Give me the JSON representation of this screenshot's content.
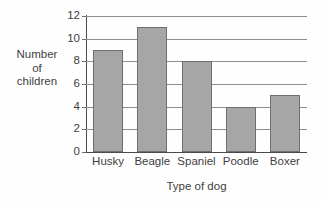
{
  "chart_data": {
    "type": "bar",
    "title": "",
    "categories": [
      "Husky",
      "Beagle",
      "Spaniel",
      "Poodle",
      "Boxer"
    ],
    "values": [
      9,
      11,
      8,
      4,
      5
    ],
    "xlabel": "Type of dog",
    "ylabel": "Number of children",
    "ylabel_lines": [
      "Number",
      "of",
      "children"
    ],
    "ylim": [
      0,
      12
    ],
    "ytick_labels": [
      "0",
      "2",
      "4",
      "6",
      "8",
      "10",
      "12"
    ],
    "ytick_values": [
      0,
      2,
      4,
      6,
      8,
      10,
      12
    ],
    "grid": "horizontal",
    "legend": "none",
    "colors": {
      "bar_fill": "#a6a6a6",
      "bar_edge": "#6f6f6f",
      "gridline": "#8e8e8e",
      "axis": "#4a4a4a",
      "text": "#3f3f3f",
      "background": "#fefefe"
    }
  }
}
